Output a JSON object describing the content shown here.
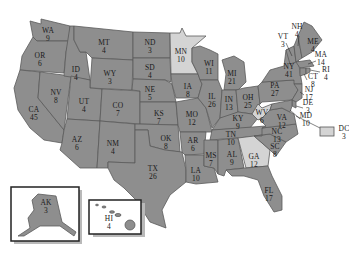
{
  "colors": {
    "state_fill": "#8e8e8e",
    "highlight_fill": "#d4d4d4",
    "border": "#5a5a5a",
    "inset_shadow": "#b9b9b9"
  },
  "legend_note": "State abbreviations with electoral vote counts",
  "states": [
    {
      "abbr": "WA",
      "votes": "9",
      "x": 48,
      "y": 33
    },
    {
      "abbr": "OR",
      "votes": "6",
      "x": 40,
      "y": 58
    },
    {
      "abbr": "CA",
      "votes": "45",
      "x": 34,
      "y": 112
    },
    {
      "abbr": "NV",
      "votes": "8",
      "x": 56,
      "y": 95
    },
    {
      "abbr": "ID",
      "votes": "4",
      "x": 76,
      "y": 72
    },
    {
      "abbr": "MT",
      "votes": "4",
      "x": 104,
      "y": 45
    },
    {
      "abbr": "WY",
      "votes": "3",
      "x": 110,
      "y": 76
    },
    {
      "abbr": "UT",
      "votes": "4",
      "x": 84,
      "y": 104
    },
    {
      "abbr": "AZ",
      "votes": "6",
      "x": 77,
      "y": 142
    },
    {
      "abbr": "CO",
      "votes": "7",
      "x": 118,
      "y": 108
    },
    {
      "abbr": "NM",
      "votes": "4",
      "x": 113,
      "y": 146
    },
    {
      "abbr": "ND",
      "votes": "3",
      "x": 150,
      "y": 45
    },
    {
      "abbr": "SD",
      "votes": "4",
      "x": 150,
      "y": 70
    },
    {
      "abbr": "NE",
      "votes": "5",
      "x": 150,
      "y": 92
    },
    {
      "abbr": "KS",
      "votes": "7",
      "x": 159,
      "y": 116
    },
    {
      "abbr": "OK",
      "votes": "8",
      "x": 166,
      "y": 141
    },
    {
      "abbr": "TX",
      "votes": "26",
      "x": 153,
      "y": 171
    },
    {
      "abbr": "MN",
      "votes": "10",
      "x": 181,
      "y": 54
    },
    {
      "abbr": "IA",
      "votes": "8",
      "x": 188,
      "y": 89
    },
    {
      "abbr": "MO",
      "votes": "12",
      "x": 192,
      "y": 117
    },
    {
      "abbr": "AR",
      "votes": "6",
      "x": 193,
      "y": 143
    },
    {
      "abbr": "LA",
      "votes": "10",
      "x": 196,
      "y": 173
    },
    {
      "abbr": "WI",
      "votes": "11",
      "x": 209,
      "y": 66
    },
    {
      "abbr": "IL",
      "votes": "26",
      "x": 212,
      "y": 99
    },
    {
      "abbr": "MS",
      "votes": "7",
      "x": 211,
      "y": 158
    },
    {
      "abbr": "MI",
      "votes": "21",
      "x": 232,
      "y": 76
    },
    {
      "abbr": "IN",
      "votes": "13",
      "x": 229,
      "y": 102
    },
    {
      "abbr": "KY",
      "votes": "9",
      "x": 238,
      "y": 121
    },
    {
      "abbr": "TN",
      "votes": "10",
      "x": 231,
      "y": 137
    },
    {
      "abbr": "AL",
      "votes": "9",
      "x": 232,
      "y": 157
    },
    {
      "abbr": "GA",
      "votes": "12",
      "x": 254,
      "y": 159
    },
    {
      "abbr": "FL",
      "votes": "17",
      "x": 269,
      "y": 193
    },
    {
      "abbr": "OH",
      "votes": "25",
      "x": 248,
      "y": 100
    },
    {
      "abbr": "WV",
      "votes": "6",
      "x": 262,
      "y": 115
    },
    {
      "abbr": "VA",
      "votes": "12",
      "x": 282,
      "y": 120
    },
    {
      "abbr": "NC",
      "votes": "13",
      "x": 277,
      "y": 134
    },
    {
      "abbr": "SC",
      "votes": "8",
      "x": 275,
      "y": 149
    },
    {
      "abbr": "PA",
      "votes": "27",
      "x": 275,
      "y": 88
    },
    {
      "abbr": "NY",
      "votes": "41",
      "x": 289,
      "y": 69
    },
    {
      "abbr": "VT",
      "votes": "3",
      "x": 283,
      "y": 39
    },
    {
      "abbr": "NH",
      "votes": "4",
      "x": 297,
      "y": 29
    },
    {
      "abbr": "ME",
      "votes": "4",
      "x": 313,
      "y": 44
    },
    {
      "abbr": "MA",
      "votes": "14",
      "x": 321,
      "y": 57
    },
    {
      "abbr": "RI",
      "votes": "4",
      "x": 326,
      "y": 72
    },
    {
      "abbr": "CT",
      "votes": "8",
      "x": 313,
      "y": 79
    },
    {
      "abbr": "NJ",
      "votes": "17",
      "x": 309,
      "y": 92
    },
    {
      "abbr": "DE",
      "votes": "3",
      "x": 308,
      "y": 105
    },
    {
      "abbr": "MD",
      "votes": "10",
      "x": 306,
      "y": 118
    },
    {
      "abbr": "DC",
      "votes": "3",
      "x": 330,
      "y": 131
    },
    {
      "abbr": "AK",
      "votes": "3",
      "x": 46,
      "y": 205
    },
    {
      "abbr": "HI",
      "votes": "4",
      "x": 109,
      "y": 221
    }
  ]
}
